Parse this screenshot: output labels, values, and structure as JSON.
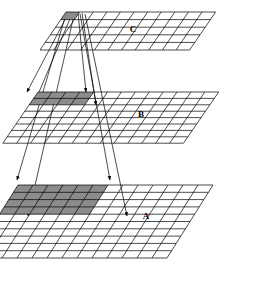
{
  "figure": {
    "title": "",
    "caption": "",
    "background_color": "#ffffff",
    "line_color": "#000000",
    "shade_color": "#8c8c8c",
    "shade_color_dark": "#7a7a7a"
  },
  "planes": [
    {
      "id": "plane-c",
      "label": "C",
      "role": "top-layer",
      "cols": 11,
      "rows": 5,
      "origin_x": 66,
      "origin_y": 12,
      "cell_u_x": 13.6,
      "cell_u_y": 0.0,
      "cell_v_x": -5.2,
      "cell_v_y": 7.6,
      "shaded": {
        "col_start": 0,
        "col_span": 1,
        "row_start": 0,
        "row_span": 1
      },
      "label_x": 133,
      "label_y": 32
    },
    {
      "id": "plane-b",
      "label": "B",
      "role": "middle-layer",
      "cols": 13,
      "rows": 8,
      "origin_x": 38,
      "origin_y": 92,
      "cell_u_x": 13.9,
      "cell_u_y": 0.0,
      "cell_v_x": -4.4,
      "cell_v_y": 6.4,
      "shaded": {
        "col_start": 0,
        "col_span": 4,
        "row_start": 0,
        "row_span": 2
      },
      "label_x": 141,
      "label_y": 117
    },
    {
      "id": "plane-a",
      "label": "A",
      "role": "bottom-layer",
      "cols": 13,
      "rows": 10,
      "origin_x": 18,
      "origin_y": 185,
      "cell_u_x": 15.0,
      "cell_u_y": 0.0,
      "cell_v_x": -4.6,
      "cell_v_y": 7.3,
      "shaded": {
        "col_start": 0,
        "col_span": 6,
        "row_start": 0,
        "row_span": 4
      },
      "label_x": 146,
      "label_y": 219
    }
  ],
  "projection_lines": [
    {
      "name": "c-to-b-left-outer",
      "x1": 68,
      "y1": 14,
      "x2": 27,
      "y2": 92,
      "arrow": true
    },
    {
      "name": "c-to-b-left-inner",
      "x1": 72,
      "y1": 14,
      "x2": 34,
      "y2": 104,
      "arrow": true
    },
    {
      "name": "c-to-a-left-outer",
      "x1": 66,
      "y1": 14,
      "x2": 17,
      "y2": 180,
      "arrow": true
    },
    {
      "name": "c-to-a-left-inner",
      "x1": 74,
      "y1": 15,
      "x2": 28,
      "y2": 216,
      "arrow": true
    },
    {
      "name": "c-to-b-right-outer",
      "x1": 78,
      "y1": 13,
      "x2": 86,
      "y2": 92,
      "arrow": true
    },
    {
      "name": "c-to-b-right-inner",
      "x1": 82,
      "y1": 13,
      "x2": 96,
      "y2": 105,
      "arrow": true
    },
    {
      "name": "c-to-a-right-outer",
      "x1": 80,
      "y1": 14,
      "x2": 110,
      "y2": 180,
      "arrow": true
    },
    {
      "name": "c-to-a-right-inner",
      "x1": 85,
      "y1": 14,
      "x2": 127,
      "y2": 216,
      "arrow": true
    }
  ],
  "legend": {
    "note": ""
  }
}
